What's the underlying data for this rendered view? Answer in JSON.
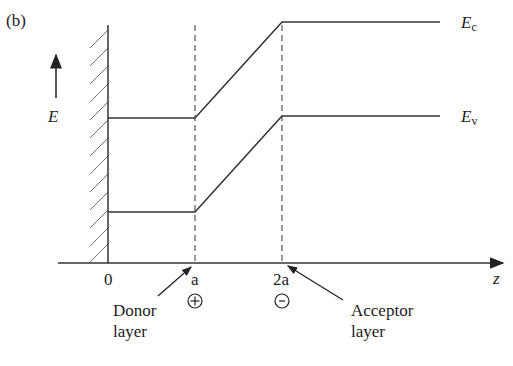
{
  "figure": {
    "panel_label": "(b)",
    "energy_axis_label": "E",
    "z_axis_label": "z",
    "bands": {
      "conduction": {
        "label": "E",
        "subscript": "c"
      },
      "valence": {
        "label": "E",
        "subscript": "v"
      }
    },
    "ticks": [
      {
        "label": "0"
      },
      {
        "label": "a",
        "charge": "+"
      },
      {
        "label": "2a",
        "charge": "-"
      }
    ],
    "annotations": {
      "donor": {
        "line1": "Donor",
        "line2": "layer"
      },
      "acceptor": {
        "line1": "Acceptor",
        "line2": "layer"
      }
    },
    "colors": {
      "line": "#333333",
      "dashed": "#555555",
      "hatch": "#666666"
    }
  }
}
